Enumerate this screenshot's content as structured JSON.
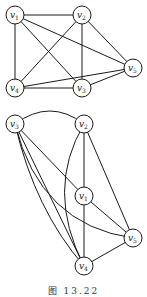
{
  "figure": {
    "caption": "图 13.22",
    "stroke_color": "#1a1a1a",
    "background": "#ffffff"
  },
  "graphs": [
    {
      "name": "graph-top",
      "nodes": [
        {
          "id": "v1",
          "label": "v",
          "sub": "1",
          "x": 15,
          "y": 15
        },
        {
          "id": "v2",
          "label": "v",
          "sub": "2",
          "x": 82,
          "y": 15
        },
        {
          "id": "v5",
          "label": "v",
          "sub": "5",
          "x": 133,
          "y": 68
        },
        {
          "id": "v4",
          "label": "v",
          "sub": "4",
          "x": 15,
          "y": 88
        },
        {
          "id": "v3",
          "label": "v",
          "sub": "3",
          "x": 82,
          "y": 88
        }
      ],
      "edges": [
        [
          "v1",
          "v2"
        ],
        [
          "v1",
          "v4"
        ],
        [
          "v1",
          "v3"
        ],
        [
          "v1",
          "v5"
        ],
        [
          "v2",
          "v4"
        ],
        [
          "v2",
          "v3"
        ],
        [
          "v2",
          "v5"
        ],
        [
          "v4",
          "v3"
        ],
        [
          "v4",
          "v5"
        ],
        [
          "v3",
          "v5"
        ]
      ]
    },
    {
      "name": "graph-bottom",
      "nodes": [
        {
          "id": "v3",
          "label": "v",
          "sub": "3",
          "x": 15,
          "y": 124
        },
        {
          "id": "v2",
          "label": "v",
          "sub": "2",
          "x": 84,
          "y": 124
        },
        {
          "id": "v1",
          "label": "v",
          "sub": "1",
          "x": 84,
          "y": 196
        },
        {
          "id": "v5",
          "label": "v",
          "sub": "5",
          "x": 133,
          "y": 238
        },
        {
          "id": "v4",
          "label": "v",
          "sub": "4",
          "x": 84,
          "y": 266
        }
      ],
      "edges": [
        [
          "v3",
          "v2",
          "arc-top"
        ],
        [
          "v3",
          "v1"
        ],
        [
          "v3",
          "v4"
        ],
        [
          "v3",
          "v4",
          "curve"
        ],
        [
          "v3",
          "v5",
          "curve"
        ],
        [
          "v2",
          "v1"
        ],
        [
          "v2",
          "v5"
        ],
        [
          "v2",
          "v4",
          "curve-left"
        ],
        [
          "v1",
          "v4"
        ],
        [
          "v1",
          "v5"
        ],
        [
          "v4",
          "v5"
        ]
      ]
    }
  ]
}
